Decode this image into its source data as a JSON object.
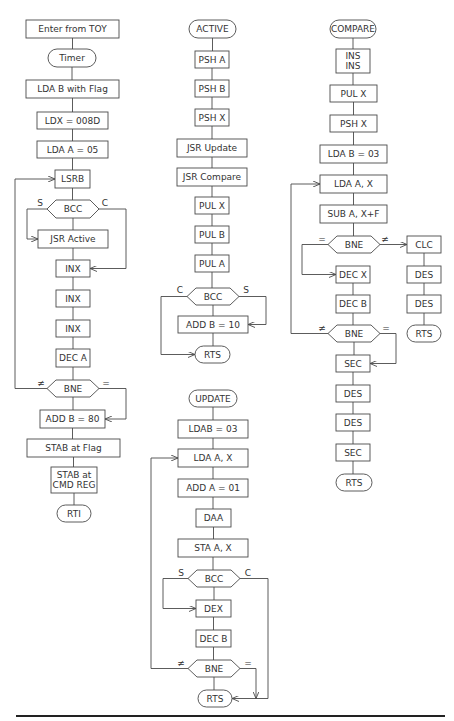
{
  "colors": {
    "stroke": "#4a4a4a",
    "text": "#333333",
    "background": "#ffffff"
  },
  "edge_labels": {
    "set": "S",
    "clear": "C",
    "not_equal": "≠",
    "equal": "="
  },
  "flowcharts": {
    "timer": {
      "nodes": [
        {
          "id": "t0",
          "shape": "rect",
          "text": "Enter from TOY"
        },
        {
          "id": "t1",
          "shape": "terminal",
          "text": "Timer"
        },
        {
          "id": "t2",
          "shape": "rect",
          "text": "LDA B with Flag"
        },
        {
          "id": "t3",
          "shape": "rect",
          "text": "LDX = 008D"
        },
        {
          "id": "t4",
          "shape": "rect",
          "text": "LDA A = 05"
        },
        {
          "id": "t5",
          "shape": "rect",
          "text": "LSRB"
        },
        {
          "id": "t6",
          "shape": "decision",
          "text": "BCC"
        },
        {
          "id": "t7",
          "shape": "rect",
          "text": "JSR Active"
        },
        {
          "id": "t8",
          "shape": "rect",
          "text": "INX"
        },
        {
          "id": "t9",
          "shape": "rect",
          "text": "INX"
        },
        {
          "id": "t10",
          "shape": "rect",
          "text": "INX"
        },
        {
          "id": "t11",
          "shape": "rect",
          "text": "DEC A"
        },
        {
          "id": "t12",
          "shape": "decision",
          "text": "BNE"
        },
        {
          "id": "t13",
          "shape": "rect",
          "text": "ADD B = 80"
        },
        {
          "id": "t14",
          "shape": "rect",
          "text": "STAB at Flag"
        },
        {
          "id": "t15",
          "shape": "rect",
          "text": "STAB at",
          "text2": "CMD REG"
        },
        {
          "id": "t16",
          "shape": "terminal",
          "text": "RTI"
        }
      ]
    },
    "active": {
      "nodes": [
        {
          "id": "a0",
          "shape": "terminal",
          "text": "ACTIVE"
        },
        {
          "id": "a1",
          "shape": "rect",
          "text": "PSH A"
        },
        {
          "id": "a2",
          "shape": "rect",
          "text": "PSH B"
        },
        {
          "id": "a3",
          "shape": "rect",
          "text": "PSH X"
        },
        {
          "id": "a4",
          "shape": "rect",
          "text": "JSR Update"
        },
        {
          "id": "a5",
          "shape": "rect",
          "text": "JSR Compare"
        },
        {
          "id": "a6",
          "shape": "rect",
          "text": "PUL X"
        },
        {
          "id": "a7",
          "shape": "rect",
          "text": "PUL B"
        },
        {
          "id": "a8",
          "shape": "rect",
          "text": "PUL A"
        },
        {
          "id": "a9",
          "shape": "decision",
          "text": "BCC"
        },
        {
          "id": "a10",
          "shape": "rect",
          "text": "ADD B = 10"
        },
        {
          "id": "a11",
          "shape": "terminal",
          "text": "RTS"
        }
      ]
    },
    "update": {
      "nodes": [
        {
          "id": "u0",
          "shape": "terminal",
          "text": "UPDATE"
        },
        {
          "id": "u1",
          "shape": "rect",
          "text": "LDAB = 03"
        },
        {
          "id": "u2",
          "shape": "rect",
          "text": "LDA A, X"
        },
        {
          "id": "u3",
          "shape": "rect",
          "text": "ADD A = 01"
        },
        {
          "id": "u4",
          "shape": "rect",
          "text": "DAA"
        },
        {
          "id": "u5",
          "shape": "rect",
          "text": "STA A, X"
        },
        {
          "id": "u6",
          "shape": "decision",
          "text": "BCC"
        },
        {
          "id": "u7",
          "shape": "rect",
          "text": "DEX"
        },
        {
          "id": "u8",
          "shape": "rect",
          "text": "DEC B"
        },
        {
          "id": "u9",
          "shape": "decision",
          "text": "BNE"
        },
        {
          "id": "u10",
          "shape": "terminal",
          "text": "RTS"
        }
      ]
    },
    "compare": {
      "nodes": [
        {
          "id": "c0",
          "shape": "terminal",
          "text": "COMPARE"
        },
        {
          "id": "c1",
          "shape": "rect",
          "text": "INS",
          "text2": "INS"
        },
        {
          "id": "c2",
          "shape": "rect",
          "text": "PUL X"
        },
        {
          "id": "c3",
          "shape": "rect",
          "text": "PSH X"
        },
        {
          "id": "c4",
          "shape": "rect",
          "text": "LDA B = 03"
        },
        {
          "id": "c5",
          "shape": "rect",
          "text": "LDA A, X"
        },
        {
          "id": "c6",
          "shape": "rect",
          "text": "SUB A, X+F"
        },
        {
          "id": "c7",
          "shape": "decision",
          "text": "BNE"
        },
        {
          "id": "c8",
          "shape": "rect",
          "text": "CLC"
        },
        {
          "id": "c9",
          "shape": "rect",
          "text": "DES"
        },
        {
          "id": "c10",
          "shape": "rect",
          "text": "DES"
        },
        {
          "id": "c11",
          "shape": "terminal",
          "text": "RTS"
        },
        {
          "id": "c12",
          "shape": "rect",
          "text": "DEC X"
        },
        {
          "id": "c13",
          "shape": "rect",
          "text": "DEC B"
        },
        {
          "id": "c14",
          "shape": "decision",
          "text": "BNE"
        },
        {
          "id": "c15",
          "shape": "rect",
          "text": "SEC"
        },
        {
          "id": "c16",
          "shape": "rect",
          "text": "DES"
        },
        {
          "id": "c17",
          "shape": "rect",
          "text": "DES"
        },
        {
          "id": "c18",
          "shape": "rect",
          "text": "SEC"
        },
        {
          "id": "c19",
          "shape": "terminal",
          "text": "RTS"
        }
      ]
    }
  }
}
